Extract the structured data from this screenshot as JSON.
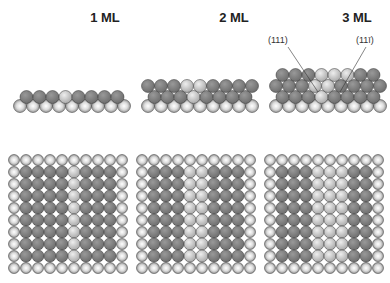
{
  "panels": [
    {
      "title": "1 ML",
      "layers": 1
    },
    {
      "title": "2 ML",
      "layers": 2
    },
    {
      "title": "3 ML",
      "layers": 3
    }
  ],
  "annotations": {
    "left": "(111)",
    "right": "(11ī)"
  },
  "colors": {
    "substrate": "#9a9a9a",
    "film": "#6e6e6e",
    "defect": "#c8c8c8",
    "outline": "#333333"
  }
}
